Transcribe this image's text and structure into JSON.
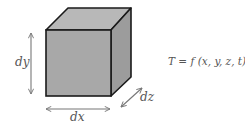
{
  "diagram": {
    "labels": {
      "dy": "dy",
      "dx": "dx",
      "dz": "dz",
      "equation": "T = f (x, y, z, t)"
    },
    "colors": {
      "front_face": "#a8a8a8",
      "top_face": "#b8b8b8",
      "side_face": "#9c9c9c",
      "edge": "#1a1a1a",
      "arrow": "#777777",
      "text": "#555555"
    }
  }
}
